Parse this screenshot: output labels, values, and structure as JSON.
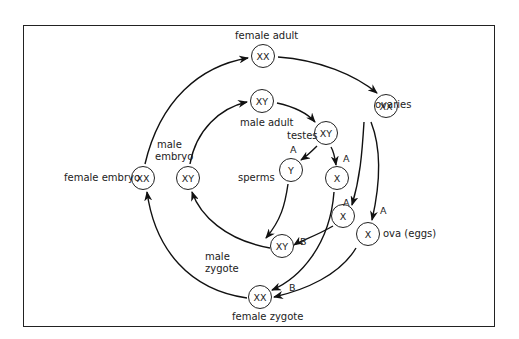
{
  "diagram": {
    "title": "",
    "nodes": [
      {
        "id": "female_adult",
        "text": "XX",
        "label": "female adult"
      },
      {
        "id": "male_adult",
        "text": "XY",
        "label": "male adult"
      },
      {
        "id": "ovaries",
        "text": "XX",
        "label": "ovaries"
      },
      {
        "id": "testes",
        "text": "XY",
        "label": "testes"
      },
      {
        "id": "sperm_y",
        "text": "Y",
        "label": "A"
      },
      {
        "id": "sperm_x",
        "text": "X",
        "label": "A"
      },
      {
        "id": "egg_a",
        "text": "X",
        "label": "A"
      },
      {
        "id": "egg_ova",
        "text": "X",
        "label": "ova (eggs)"
      },
      {
        "id": "male_zygote",
        "text": "XY",
        "label": "male zygote"
      },
      {
        "id": "female_zygote",
        "text": "XX",
        "label": "female zygote"
      },
      {
        "id": "female_embryo",
        "text": "XX",
        "label": "female embryo"
      },
      {
        "id": "male_embryo",
        "text": "XY",
        "label": "male embryo"
      }
    ],
    "labels": {
      "female_adult": "female adult",
      "male_adult": "male adult",
      "ovaries": "ovaries",
      "testes": "testes",
      "sperms": "sperms",
      "ova": "ova (eggs)",
      "male_zygote_1": "male",
      "male_zygote_2": "zygote",
      "female_zygote": "female zygote",
      "female_embryo": "female embryo",
      "male_embryo_1": "male",
      "male_embryo_2": "embryo"
    },
    "markers": {
      "a": "A",
      "b": "B"
    },
    "edges": [
      [
        "female_embryo",
        "female_adult"
      ],
      [
        "female_adult",
        "ovaries"
      ],
      [
        "ovaries",
        "egg_a"
      ],
      [
        "ovaries",
        "egg_ova"
      ],
      [
        "male_embryo",
        "male_adult"
      ],
      [
        "male_adult",
        "testes"
      ],
      [
        "testes",
        "sperm_y"
      ],
      [
        "testes",
        "sperm_x"
      ],
      [
        "sperm_y",
        "male_zygote"
      ],
      [
        "egg_a",
        "male_zygote"
      ],
      [
        "sperm_x",
        "female_zygote"
      ],
      [
        "egg_ova",
        "female_zygote"
      ],
      [
        "male_zygote",
        "male_embryo"
      ],
      [
        "female_zygote",
        "female_embryo"
      ]
    ]
  }
}
